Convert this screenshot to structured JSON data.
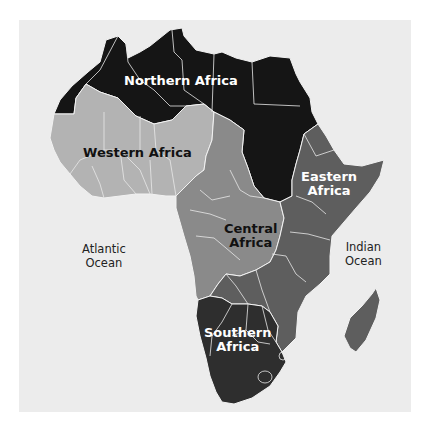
{
  "map": {
    "title": "Regions of Africa",
    "colors": {
      "background": "#ffffff",
      "sea": "#ececec",
      "northern_africa": "#151515",
      "western_africa": "#b3b3b3",
      "central_africa": "#8a8a8a",
      "eastern_africa": "#5e5e5e",
      "southern_africa": "#2e2e2e",
      "borders": "#f2f2f2"
    },
    "regions": [
      {
        "id": "northern",
        "label": "Northern Africa"
      },
      {
        "id": "western",
        "label": "Western Africa"
      },
      {
        "id": "central",
        "label": "Central Africa",
        "line1": "Central",
        "line2": "Africa"
      },
      {
        "id": "eastern",
        "label": "Eastern Africa",
        "line1": "Eastern",
        "line2": "Africa"
      },
      {
        "id": "southern",
        "label": "Southern Africa",
        "line1": "Southern",
        "line2": "Africa"
      }
    ],
    "oceans": [
      {
        "id": "atlantic",
        "line1": "Atlantic",
        "line2": "Ocean"
      },
      {
        "id": "indian",
        "line1": "Indian",
        "line2": "Ocean"
      }
    ]
  }
}
